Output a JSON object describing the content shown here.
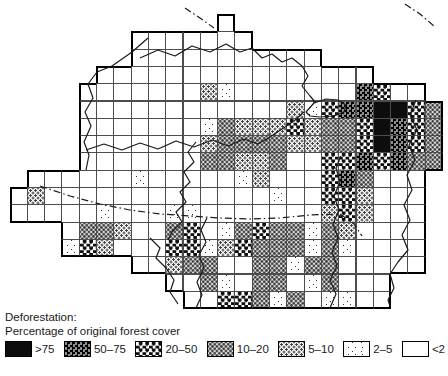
{
  "figure": {
    "title_line1": "Deforestation:",
    "title_line2": "Percentage of original forest cover"
  },
  "legend": {
    "items": [
      {
        "key": "f",
        "label": ">75"
      },
      {
        "key": "e",
        "label": "50–75"
      },
      {
        "key": "d",
        "label": "20–50"
      },
      {
        "key": "c",
        "label": "10–20"
      },
      {
        "key": "b",
        "label": "5–10"
      },
      {
        "key": "a",
        "label": "2–5"
      },
      {
        "key": "0",
        "label": "<2"
      }
    ]
  },
  "map": {
    "grid": {
      "cols": 25,
      "rows": 17,
      "origin_x": 9.5,
      "origin_y": 14,
      "cell_w": 17.3,
      "cell_h": 17.3,
      "category_labels": {
        "0": "<2",
        "a": "2–5",
        "b": "5–10",
        "c": "10–20",
        "d": "20–50",
        "e": "50–75",
        "f": ">75"
      },
      "cells": [
        "............0............",
        ".......0000000...........",
        ".......00000000000.......",
        ".....0000000000000000....",
        "....0000000ba0000000ed00.",
        "....000000000000badeeffdc",
        "....0000000acbbbdbccdfedc",
        "....0000000bccccbbccdfedc",
        "....0000000ccbbc00ddedecc",
        ".000000a00000ab000dec000.",
        "0b0000000000000a00ddb000.",
        "00000a000aa0000000bdb000.",
        "...0ccb00cd0acdccacb0000.",
        "...adb000ddabdcccaca0000.",
        ".......00bcc00ccacc00000.",
        ".........00ca0cc0ac000...",
        "..........00ddcac0aa00..."
      ]
    },
    "rivers": [
      [
        [
          148,
          38
        ],
        [
          132,
          52
        ],
        [
          112,
          66
        ],
        [
          97,
          72
        ],
        [
          88,
          84
        ],
        [
          93,
          98
        ],
        [
          85,
          112
        ],
        [
          91,
          126
        ],
        [
          84,
          142
        ],
        [
          89,
          155
        ],
        [
          86,
          170
        ]
      ],
      [
        [
          140,
          58
        ],
        [
          158,
          50
        ],
        [
          175,
          56
        ],
        [
          192,
          46
        ],
        [
          210,
          52
        ],
        [
          226,
          44
        ],
        [
          240,
          52
        ],
        [
          252,
          48
        ],
        [
          262,
          58
        ],
        [
          272,
          54
        ],
        [
          282,
          62
        ],
        [
          292,
          58
        ],
        [
          302,
          66
        ],
        [
          308,
          76
        ],
        [
          302,
          86
        ],
        [
          310,
          96
        ],
        [
          316,
          103
        ]
      ],
      [
        [
          86,
          150
        ],
        [
          104,
          144
        ],
        [
          122,
          150
        ],
        [
          140,
          143
        ],
        [
          158,
          149
        ],
        [
          176,
          141
        ],
        [
          194,
          147
        ],
        [
          212,
          140
        ],
        [
          228,
          146
        ],
        [
          244,
          139
        ],
        [
          258,
          144
        ],
        [
          270,
          137
        ],
        [
          282,
          129
        ],
        [
          294,
          121
        ],
        [
          304,
          112
        ]
      ],
      [
        [
          306,
          112
        ],
        [
          314,
          103
        ],
        [
          326,
          99
        ],
        [
          338,
          100
        ],
        [
          346,
          105
        ],
        [
          344,
          112
        ],
        [
          334,
          116
        ],
        [
          320,
          117
        ],
        [
          310,
          116
        ],
        [
          306,
          112
        ]
      ],
      [
        [
          196,
          142
        ],
        [
          188,
          152
        ],
        [
          194,
          162
        ],
        [
          184,
          172
        ],
        [
          190,
          182
        ],
        [
          180,
          192
        ],
        [
          186,
          202
        ],
        [
          176,
          212
        ],
        [
          182,
          222
        ],
        [
          172,
          232
        ],
        [
          168,
          240
        ]
      ],
      [
        [
          150,
          238
        ],
        [
          160,
          248
        ],
        [
          156,
          258
        ],
        [
          166,
          268
        ],
        [
          174,
          280
        ],
        [
          170,
          292
        ],
        [
          178,
          304
        ]
      ],
      [
        [
          196,
          308
        ],
        [
          202,
          295
        ],
        [
          197,
          282
        ],
        [
          204,
          268
        ],
        [
          199,
          255
        ],
        [
          206,
          242
        ],
        [
          201,
          230
        ],
        [
          207,
          218
        ]
      ],
      [
        [
          330,
          308
        ],
        [
          336,
          294
        ],
        [
          330,
          280
        ],
        [
          337,
          266
        ],
        [
          332,
          252
        ],
        [
          338,
          238
        ],
        [
          333,
          224
        ],
        [
          339,
          210
        ],
        [
          334,
          196
        ],
        [
          340,
          182
        ],
        [
          336,
          168
        ],
        [
          341,
          156
        ]
      ],
      [
        [
          416,
          100
        ],
        [
          410,
          115
        ],
        [
          417,
          130
        ],
        [
          409,
          145
        ],
        [
          415,
          160
        ],
        [
          407,
          175
        ],
        [
          412,
          190
        ],
        [
          404,
          205
        ],
        [
          410,
          220
        ],
        [
          402,
          235
        ],
        [
          408,
          250
        ],
        [
          398,
          262
        ],
        [
          390,
          274
        ],
        [
          394,
          288
        ],
        [
          388,
          300
        ],
        [
          390,
          306
        ]
      ]
    ],
    "borders": [
      [
        [
          185,
          8
        ],
        [
          200,
          18
        ],
        [
          214,
          28
        ]
      ],
      [
        [
          405,
          4
        ],
        [
          420,
          14
        ],
        [
          434,
          26
        ]
      ],
      [
        [
          40,
          186
        ],
        [
          70,
          196
        ],
        [
          100,
          204
        ],
        [
          130,
          210
        ],
        [
          160,
          214
        ],
        [
          190,
          216
        ],
        [
          220,
          218
        ],
        [
          250,
          219
        ],
        [
          280,
          218
        ],
        [
          310,
          215
        ],
        [
          340,
          214
        ]
      ],
      [
        [
          340,
          214
        ],
        [
          354,
          224
        ],
        [
          362,
          236
        ]
      ]
    ]
  },
  "colors": {
    "ink": "#1a1a1a",
    "paper": "#ffffff"
  }
}
